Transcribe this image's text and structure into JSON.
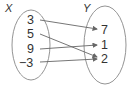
{
  "diagram": {
    "type": "mapping",
    "domain_label": "X",
    "range_label": "Y",
    "domain": [
      "3",
      "5",
      "9",
      "−3"
    ],
    "range": [
      "7",
      "1",
      "2"
    ],
    "mappings": [
      {
        "from": "3",
        "to": "7"
      },
      {
        "from": "5",
        "to": "2"
      },
      {
        "from": "9",
        "to": "1"
      },
      {
        "from": "−3",
        "to": "2"
      }
    ],
    "colors": {
      "stroke": "#777777",
      "text": "#333333"
    }
  }
}
